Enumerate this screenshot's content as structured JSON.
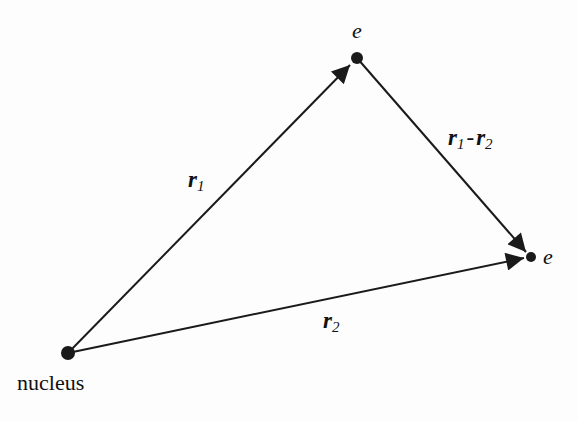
{
  "diagram": {
    "type": "vector-triangle",
    "nodes": {
      "nucleus": {
        "label": "nucleus",
        "x": 68,
        "y": 353
      },
      "electron1": {
        "label": "e",
        "x": 357,
        "y": 58
      },
      "electron2": {
        "label": "e",
        "x": 531,
        "y": 257
      }
    },
    "edges": [
      {
        "from": "nucleus",
        "to": "electron1",
        "label": "r",
        "subscript": "1"
      },
      {
        "from": "electron1",
        "to": "electron2",
        "label": "r",
        "subscript": "1",
        "minus": "-",
        "label2": "r",
        "subscript2": "2"
      },
      {
        "from": "nucleus",
        "to": "electron2",
        "label": "r",
        "subscript": "2"
      }
    ],
    "colors": {
      "line": "#1a1a1a",
      "background": "#fdfdfd"
    }
  }
}
